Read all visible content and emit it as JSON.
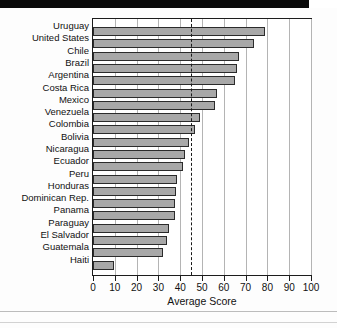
{
  "chart_data": {
    "type": "bar",
    "orientation": "horizontal",
    "title": "",
    "xlabel": "Average Score",
    "ylabel": "",
    "xlim": [
      0,
      100
    ],
    "ylim": null,
    "grid": true,
    "legend": null,
    "xticks": [
      0,
      10,
      20,
      30,
      40,
      50,
      60,
      70,
      80,
      90,
      100
    ],
    "categories": [
      "Uruguay",
      "United States",
      "Chile",
      "Brazil",
      "Argentina",
      "Costa Rica",
      "Mexico",
      "Venezuela",
      "Colombia",
      "Bolivia",
      "Nicaragua",
      "Ecuador",
      "Peru",
      "Honduras",
      "Dominican Rep.",
      "Panama",
      "Paraguay",
      "El Salvador",
      "Guatemala",
      "Haiti"
    ],
    "values": [
      79,
      74,
      67,
      66,
      65,
      57,
      56,
      49,
      47,
      44,
      42,
      41.5,
      38.5,
      38,
      37.5,
      37.5,
      35,
      34,
      32,
      9.5
    ],
    "annotations": [
      {
        "type": "vertical-reference-line",
        "value": 45,
        "style": "dashed",
        "label": ""
      }
    ],
    "colors": {
      "bar_fill": "#a8a8a8",
      "bar_edge": "#2b2b2b",
      "grid": "#b4b4b4",
      "axis": "#1c1c1c",
      "reference_line": "#1a1a1a",
      "background": "#ffffff"
    }
  }
}
